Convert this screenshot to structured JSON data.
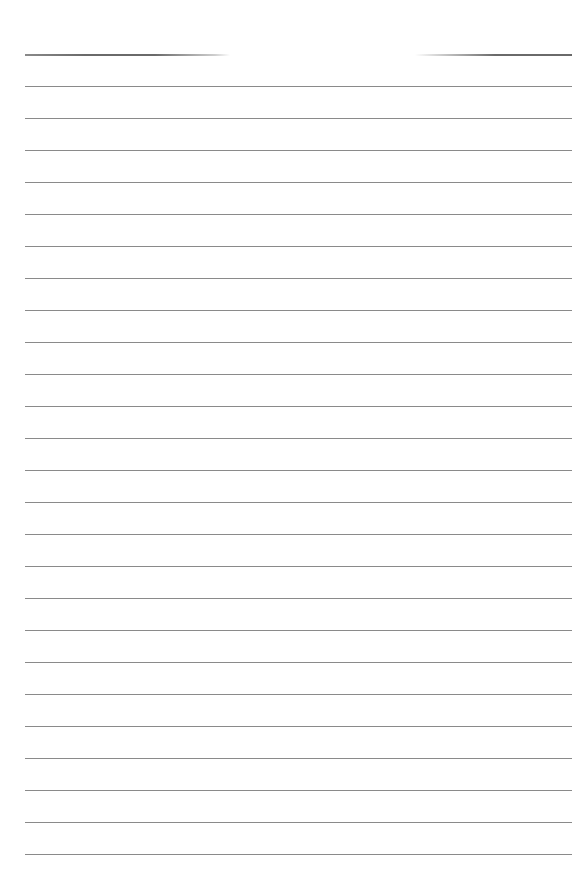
{
  "page": {
    "type": "lined-paper",
    "background_color": "#ffffff",
    "line_color": "#8a8a8a",
    "line_count": 26,
    "first_line_y": 54,
    "line_spacing": 32,
    "line_left_x": 25,
    "line_right_x": 572,
    "text": ""
  }
}
